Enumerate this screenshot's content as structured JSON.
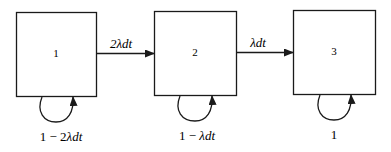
{
  "diagram": {
    "type": "markov-chain",
    "states": [
      {
        "id": "1",
        "label": "1",
        "self_loop_label": "1 − 2λdt",
        "self_loop_prefix": "1 − 2",
        "self_loop_italic": "λdt"
      },
      {
        "id": "2",
        "label": "2",
        "self_loop_label": "1 − λdt",
        "self_loop_prefix": "1 − ",
        "self_loop_italic": "λdt"
      },
      {
        "id": "3",
        "label": "3",
        "self_loop_label": "1",
        "self_loop_prefix": "1",
        "self_loop_italic": ""
      }
    ],
    "transitions": [
      {
        "from": "1",
        "to": "2",
        "label": "2λdt"
      },
      {
        "from": "2",
        "to": "3",
        "label": "λdt"
      }
    ],
    "colors": {
      "stroke": "#1a1a1a",
      "background": "#ffffff"
    }
  }
}
